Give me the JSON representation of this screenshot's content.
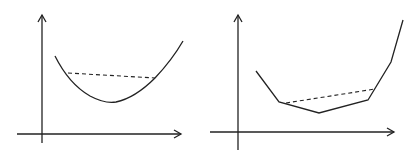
{
  "diagram": {
    "panels": [
      {
        "name": "smooth-convex-function",
        "curve_type": "smooth",
        "secant": "dashed"
      },
      {
        "name": "piecewise-linear-convex-function",
        "curve_type": "polyline",
        "secant": "dashed"
      }
    ],
    "colors": {
      "stroke": "#222222",
      "background": "#ffffff"
    }
  }
}
